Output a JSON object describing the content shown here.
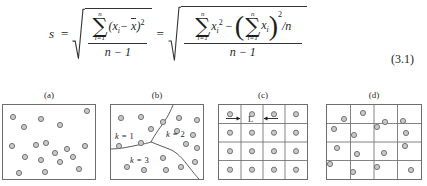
{
  "equation": {
    "lhs_variable": "s",
    "relation_1": "=",
    "relation_2": "=",
    "equation_number": "(3.1)",
    "left_radical": {
      "numerator": {
        "sigma_upper": "n",
        "sigma_glyph": "∑",
        "sigma_lower": "i=1",
        "term": "(x",
        "term_sub": "i",
        "term_mid": "− ",
        "term_bar": "x",
        "term_close": ")",
        "term_exponent": "2"
      },
      "denominator": "n − 1"
    },
    "right_radical": {
      "numerator": {
        "sigma1_upper": "n",
        "sigma1_glyph": "∑",
        "sigma1_lower": "i=1",
        "term1": "x",
        "term1_sub": "i",
        "term1_exp": "2",
        "minus": "−",
        "paren_open": "(",
        "sigma2_upper": "n",
        "sigma2_glyph": "∑",
        "sigma2_lower": "i=1",
        "term2": "x",
        "term2_sub": "i",
        "paren_close": ")",
        "paren_exp": "2",
        "divisor": "/n"
      },
      "denominator": "n − 1"
    }
  },
  "figure": {
    "panels": [
      {
        "id": "a",
        "caption": "(a)",
        "type": "scatter-random",
        "points": [
          [
            10,
            12
          ],
          [
            21,
            22
          ],
          [
            38,
            14
          ],
          [
            57,
            20
          ],
          [
            84,
            6
          ],
          [
            9,
            41
          ],
          [
            33,
            40
          ],
          [
            43,
            38
          ],
          [
            52,
            48
          ],
          [
            64,
            44
          ],
          [
            82,
            41
          ],
          [
            22,
            52
          ],
          [
            38,
            55
          ],
          [
            57,
            57
          ],
          [
            70,
            52
          ],
          [
            16,
            68
          ],
          [
            42,
            67
          ],
          [
            76,
            64
          ]
        ],
        "width": 94,
        "height": 76
      },
      {
        "id": "b",
        "caption": "(b)",
        "type": "scatter-regions",
        "region_labels": [
          {
            "text_k": "k",
            "text_eq": "=",
            "text_val": "1",
            "x": 6,
            "y": 33
          },
          {
            "text_k": "k",
            "text_eq": "=",
            "text_val": "2",
            "x": 57,
            "y": 31
          },
          {
            "text_k": "k",
            "text_eq": "=",
            "text_val": "3",
            "x": 21,
            "y": 57
          }
        ],
        "points": [
          [
            10,
            13
          ],
          [
            30,
            12
          ],
          [
            52,
            17
          ],
          [
            68,
            13
          ],
          [
            86,
            15
          ],
          [
            9,
            25
          ],
          [
            40,
            24
          ],
          [
            66,
            26
          ],
          [
            82,
            30
          ],
          [
            8,
            41
          ],
          [
            30,
            38
          ],
          [
            75,
            39
          ],
          [
            86,
            43
          ],
          [
            52,
            53
          ],
          [
            16,
            62
          ],
          [
            33,
            65
          ],
          [
            55,
            65
          ],
          [
            70,
            62
          ],
          [
            84,
            57
          ]
        ],
        "width": 94,
        "height": 76
      },
      {
        "id": "c",
        "caption": "(c)",
        "type": "grid-regular",
        "cols": 4,
        "rows": 4,
        "label_L": "L",
        "points_per_cell_centered": true,
        "width": 90,
        "height": 76
      },
      {
        "id": "d",
        "caption": "(d)",
        "type": "grid-random",
        "cols": 4,
        "rows": 4,
        "points": [
          [
            17,
            14
          ],
          [
            36,
            8
          ],
          [
            58,
            17
          ],
          [
            76,
            16
          ],
          [
            7,
            24
          ],
          [
            27,
            30
          ],
          [
            50,
            22
          ],
          [
            79,
            28
          ],
          [
            10,
            43
          ],
          [
            30,
            49
          ],
          [
            57,
            48
          ],
          [
            78,
            41
          ],
          [
            3,
            59
          ],
          [
            26,
            67
          ],
          [
            50,
            62
          ],
          [
            84,
            65
          ]
        ],
        "width": 96,
        "height": 76
      }
    ]
  },
  "colors": {
    "dot_fill": "#c8c8c8",
    "dot_stroke": "#6a6a6a",
    "panel_border": "#6e6e6e",
    "text": "#1d1d1d",
    "rule": "#343434"
  }
}
